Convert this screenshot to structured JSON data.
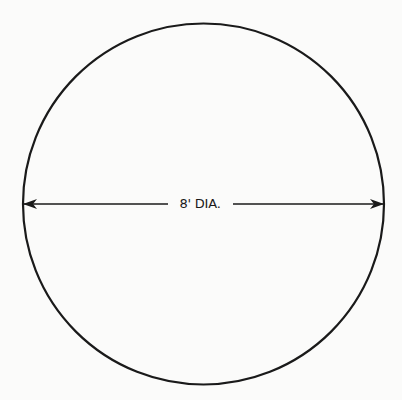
{
  "diagram": {
    "type": "dimensioned-circle",
    "shape": "circle",
    "dimension": {
      "label": "8' DIA.",
      "value": 8,
      "unit": "ft",
      "measure": "diameter",
      "orientation": "horizontal",
      "arrowheads": "both-ends"
    },
    "colors": {
      "stroke": "#1a1a1a",
      "background": "#fbfbfa"
    }
  }
}
